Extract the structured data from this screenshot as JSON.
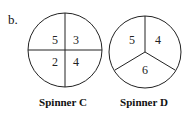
{
  "part_label": "b.",
  "spinners": [
    {
      "name": "Spinner C",
      "sections": [
        "5",
        "3",
        "2",
        "4"
      ]
    },
    {
      "name": "Spinner D",
      "sections": [
        "5",
        "4",
        "6"
      ]
    }
  ]
}
